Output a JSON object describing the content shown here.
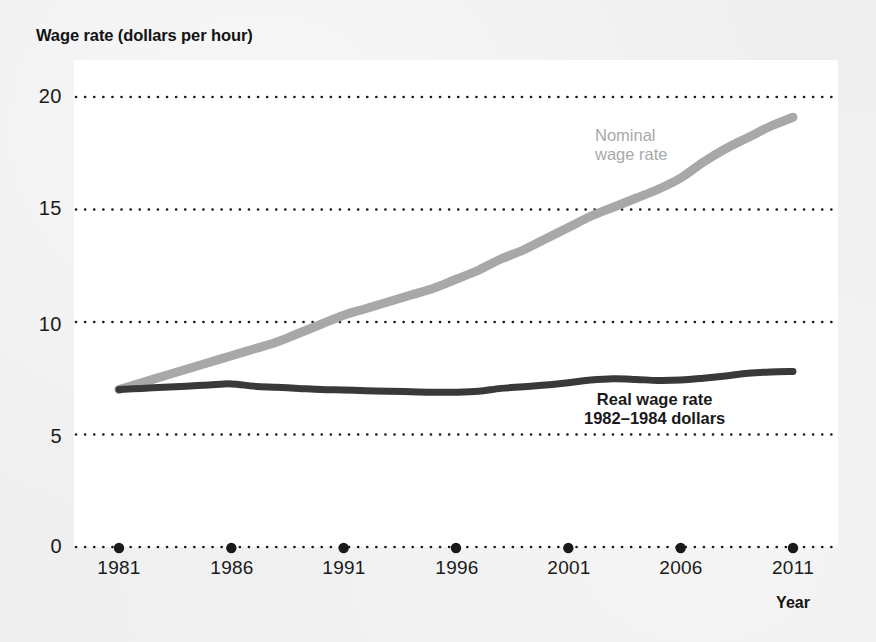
{
  "figure": {
    "title": "Wage rate (dollars per hour)",
    "background_color": "#efefef",
    "plot_background_color": "#ffffff"
  },
  "axes": {
    "x_axis_title": "Year",
    "y_tick_labels": [
      "20",
      "15",
      "10",
      "5",
      "0"
    ],
    "x_tick_labels": [
      "1981",
      "1986",
      "1991",
      "1996",
      "2001",
      "2006",
      "2011"
    ]
  },
  "labels": {
    "nominal_line1": "Nominal",
    "nominal_line2": "wage rate",
    "real_line1": "Real wage rate",
    "real_line2": "1982–1984 dollars"
  },
  "colors": {
    "nominal_wage_line": "#a8a8a8",
    "real_wage_line": "#393939",
    "gridline": "#1a1a1a",
    "text": "#1a1a1a"
  },
  "chart_data": {
    "type": "line",
    "title": "Wage rate (dollars per hour)",
    "xlabel": "Year",
    "ylabel": "Wage rate (dollars per hour)",
    "xlim": [
      1981,
      2011
    ],
    "ylim": [
      0,
      21.5
    ],
    "yticks": [
      0,
      5,
      10,
      15,
      20
    ],
    "xticks": [
      1981,
      1986,
      1991,
      1996,
      2001,
      2006,
      2011
    ],
    "grid": "horizontal-dotted",
    "legend": "inline-annotations",
    "x": [
      1981,
      1982,
      1983,
      1984,
      1985,
      1986,
      1987,
      1988,
      1989,
      1990,
      1991,
      1992,
      1993,
      1994,
      1995,
      1996,
      1997,
      1998,
      1999,
      2000,
      2001,
      2002,
      2003,
      2004,
      2005,
      2006,
      2007,
      2008,
      2009,
      2010,
      2011
    ],
    "series": [
      {
        "name": "Nominal wage rate",
        "color": "#a8a8a8",
        "values": [
          7.0,
          7.3,
          7.6,
          7.9,
          8.2,
          8.5,
          8.8,
          9.1,
          9.5,
          9.9,
          10.3,
          10.6,
          10.9,
          11.2,
          11.5,
          11.9,
          12.3,
          12.8,
          13.2,
          13.7,
          14.2,
          14.7,
          15.1,
          15.5,
          15.9,
          16.4,
          17.1,
          17.7,
          18.2,
          18.7,
          19.1
        ]
      },
      {
        "name": "Real wage rate",
        "subtitle": "1982–1984 dollars",
        "color": "#393939",
        "values": [
          7.0,
          7.05,
          7.1,
          7.15,
          7.2,
          7.25,
          7.15,
          7.1,
          7.05,
          7.0,
          6.98,
          6.95,
          6.92,
          6.9,
          6.88,
          6.88,
          6.92,
          7.05,
          7.12,
          7.2,
          7.3,
          7.42,
          7.48,
          7.45,
          7.4,
          7.42,
          7.5,
          7.6,
          7.72,
          7.78,
          7.8
        ]
      }
    ]
  }
}
